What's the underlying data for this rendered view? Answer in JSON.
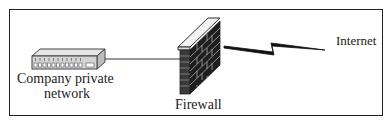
{
  "diagram": {
    "nodes": [
      {
        "id": "hub",
        "icon": "network-hub-icon",
        "label_line1": "Company private",
        "label_line2": "network"
      },
      {
        "id": "firewall",
        "icon": "brick-firewall-icon",
        "label": "Firewall"
      },
      {
        "id": "internet",
        "icon": "lightning-link-icon",
        "label": "Internet"
      }
    ],
    "edges": [
      {
        "from": "hub",
        "to": "firewall",
        "style": "line"
      },
      {
        "from": "firewall",
        "to": "internet",
        "style": "lightning"
      }
    ]
  }
}
